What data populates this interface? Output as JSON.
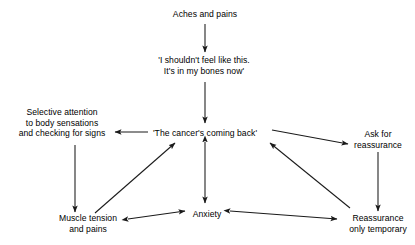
{
  "diagram": {
    "background_color": "#ffffff",
    "stroke_color": "#1a1a1a",
    "text_color": "#000000",
    "nodes": [
      {
        "id": "aches-and-pains",
        "name": "node-aches-and-pains",
        "x": 205,
        "y": 14,
        "lines": [
          "Aches and pains"
        ]
      },
      {
        "id": "thought-bones",
        "name": "node-shouldnt-feel-like-this",
        "x": 204,
        "y": 66,
        "lines": [
          "'I shouldn't feel like this.",
          "It's in my bones now'"
        ]
      },
      {
        "id": "selective-attention",
        "name": "node-selective-attention",
        "x": 62,
        "y": 123,
        "lines": [
          "Selective attention",
          "to body sensations",
          "and checking for signs"
        ]
      },
      {
        "id": "cancer-coming-back",
        "name": "node-cancers-coming-back",
        "x": 205,
        "y": 133,
        "lines": [
          "'The cancer's coming back'"
        ]
      },
      {
        "id": "ask-for-reassurance",
        "name": "node-ask-for-reassurance",
        "x": 378,
        "y": 140,
        "lines": [
          "Ask for",
          "reassurance"
        ]
      },
      {
        "id": "muscle-tension",
        "name": "node-muscle-tension-and-pains",
        "x": 88,
        "y": 224,
        "lines": [
          "Muscle tension",
          "and pains"
        ]
      },
      {
        "id": "anxiety",
        "name": "node-anxiety",
        "x": 207,
        "y": 214,
        "lines": [
          "Anxiety"
        ]
      },
      {
        "id": "reassurance-temporary",
        "name": "node-reassurance-only-temporary",
        "x": 378,
        "y": 224,
        "lines": [
          "Reassurance",
          "only temporary"
        ]
      }
    ],
    "edges": [
      {
        "id": "e1",
        "name": "arrow-aches-to-thought",
        "from": "aches-and-pains",
        "to": "thought-bones",
        "x1": 205,
        "y1": 24,
        "x2": 205,
        "y2": 52,
        "heads": "end"
      },
      {
        "id": "e2",
        "name": "arrow-thought-to-cancer",
        "from": "thought-bones",
        "to": "cancer-coming-back",
        "x1": 205,
        "y1": 82,
        "x2": 205,
        "y2": 123,
        "heads": "end"
      },
      {
        "id": "e3",
        "name": "arrow-cancer-to-selective-attention",
        "from": "cancer-coming-back",
        "to": "selective-attention",
        "x1": 148,
        "y1": 132,
        "x2": 115,
        "y2": 132,
        "heads": "end"
      },
      {
        "id": "e4",
        "name": "arrow-cancer-to-ask-reassurance",
        "from": "cancer-coming-back",
        "to": "ask-for-reassurance",
        "x1": 272,
        "y1": 130,
        "x2": 348,
        "y2": 144,
        "heads": "end"
      },
      {
        "id": "e5",
        "name": "arrow-selective-attention-to-muscle-tension",
        "from": "selective-attention",
        "to": "muscle-tension",
        "x1": 75,
        "y1": 145,
        "x2": 75,
        "y2": 212,
        "heads": "end"
      },
      {
        "id": "e6",
        "name": "arrow-ask-reassurance-to-reassurance-temporary",
        "from": "ask-for-reassurance",
        "to": "reassurance-temporary",
        "x1": 378,
        "y1": 152,
        "x2": 378,
        "y2": 211,
        "heads": "end"
      },
      {
        "id": "e7",
        "name": "arrow-muscle-tension-to-cancer",
        "from": "muscle-tension",
        "to": "cancer-coming-back",
        "x1": 95,
        "y1": 213,
        "x2": 175,
        "y2": 143,
        "heads": "end"
      },
      {
        "id": "e8",
        "name": "arrow-reassurance-temporary-to-cancer",
        "from": "reassurance-temporary",
        "to": "cancer-coming-back",
        "x1": 350,
        "y1": 208,
        "x2": 270,
        "y2": 143,
        "heads": "end"
      },
      {
        "id": "e9",
        "name": "arrow-cancer-anxiety-bidirectional",
        "from": "cancer-coming-back",
        "to": "anxiety",
        "x1": 205,
        "y1": 142,
        "x2": 205,
        "y2": 203,
        "heads": "both"
      },
      {
        "id": "e10",
        "name": "arrow-muscle-tension-anxiety-bidirectional",
        "from": "muscle-tension",
        "to": "anxiety",
        "x1": 128,
        "y1": 219,
        "x2": 185,
        "y2": 211,
        "heads": "both"
      },
      {
        "id": "e11",
        "name": "arrow-anxiety-reassurance-temporary-bidirectional",
        "from": "anxiety",
        "to": "reassurance-temporary",
        "x1": 230,
        "y1": 211,
        "x2": 337,
        "y2": 219,
        "heads": "both"
      }
    ]
  }
}
